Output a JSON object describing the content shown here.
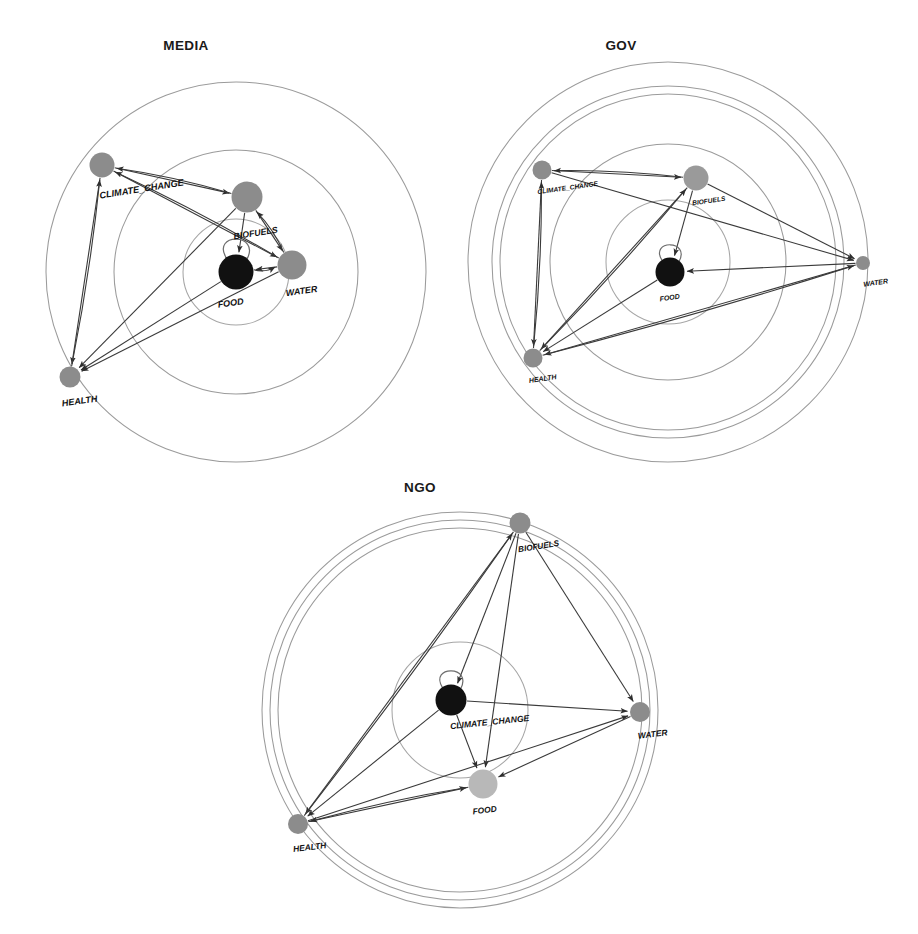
{
  "figure": {
    "type": "network-diagram",
    "node_names": [
      "CLIMATE_CHANGE",
      "BIOFUELS",
      "FOOD",
      "WATER",
      "HEALTH"
    ],
    "colors": {
      "node_dark": "#111111",
      "node_mid_gray": "#8c8c8c",
      "node_light_gray": "#b8b8b8",
      "ring_stroke": "#9b9b9b",
      "edge_stroke": "#3a3a3a",
      "title_text": "#1a1a1a",
      "background": "#ffffff"
    }
  },
  "panels": [
    {
      "id": "media",
      "title": "MEDIA",
      "title_x": 186,
      "title_y": 50,
      "center": {
        "x": 236,
        "y": 272
      },
      "rings": [
        {
          "r": 53
        },
        {
          "r": 122
        },
        {
          "r": 190
        }
      ],
      "nodes": [
        {
          "name": "CLIMATE_CHANGE",
          "label": "CLIMATE_CHANGE",
          "x": 102,
          "y": 165,
          "r": 12.5,
          "color": "#8c8c8c",
          "label_x": 142,
          "label_y": 192,
          "label_size": 9.2,
          "label_rotate": -9
        },
        {
          "name": "BIOFUELS",
          "label": "BIOFUELS",
          "x": 247,
          "y": 197,
          "r": 15.5,
          "color": "#8c8c8c",
          "label_x": 256,
          "label_y": 236,
          "label_size": 8.8,
          "label_rotate": -9
        },
        {
          "name": "FOOD",
          "label": "FOOD",
          "x": 236,
          "y": 272,
          "r": 17.5,
          "color": "#111111",
          "label_x": 231,
          "label_y": 306,
          "label_size": 9.0,
          "label_rotate": -8
        },
        {
          "name": "WATER",
          "label": "WATER",
          "x": 292,
          "y": 265,
          "r": 14.5,
          "color": "#8c8c8c",
          "label_x": 302,
          "label_y": 294,
          "label_size": 9.0,
          "label_rotate": -8
        },
        {
          "name": "HEALTH",
          "label": "HEALTH",
          "x": 70,
          "y": 377,
          "r": 10.5,
          "color": "#8c8c8c",
          "label_x": 80,
          "label_y": 404,
          "label_size": 9.0,
          "label_rotate": -8
        }
      ],
      "edges": [
        {
          "from": "CLIMATE_CHANGE",
          "to": "BIOFUELS",
          "arrow": true
        },
        {
          "from": "BIOFUELS",
          "to": "CLIMATE_CHANGE",
          "arrow": true
        },
        {
          "from": "CLIMATE_CHANGE",
          "to": "HEALTH",
          "arrow": true
        },
        {
          "from": "HEALTH",
          "to": "CLIMATE_CHANGE",
          "arrow": true
        },
        {
          "from": "CLIMATE_CHANGE",
          "to": "WATER",
          "arrow": true
        },
        {
          "from": "WATER",
          "to": "CLIMATE_CHANGE",
          "arrow": true
        },
        {
          "from": "BIOFUELS",
          "to": "FOOD",
          "arrow": true
        },
        {
          "from": "BIOFUELS",
          "to": "HEALTH",
          "arrow": true
        },
        {
          "from": "BIOFUELS",
          "to": "WATER",
          "arrow": true
        },
        {
          "from": "WATER",
          "to": "BIOFUELS",
          "arrow": true
        },
        {
          "from": "WATER",
          "to": "FOOD",
          "arrow": true
        },
        {
          "from": "FOOD",
          "to": "WATER",
          "arrow": true
        },
        {
          "from": "FOOD",
          "to": "HEALTH",
          "arrow": true
        },
        {
          "from": "WATER",
          "to": "HEALTH",
          "arrow": true
        }
      ],
      "self_loops": [
        {
          "node": "FOOD"
        }
      ]
    },
    {
      "id": "gov",
      "title": "GOV",
      "title_x": 621,
      "title_y": 50,
      "center": {
        "x": 668,
        "y": 262
      },
      "rings": [
        {
          "r": 62
        },
        {
          "r": 118
        },
        {
          "r": 168
        },
        {
          "r": 176
        },
        {
          "r": 200
        }
      ],
      "nodes": [
        {
          "name": "CLIMATE_CHANGE",
          "label": "CLIMATE_CHANGE",
          "x": 542,
          "y": 170,
          "r": 9.5,
          "color": "#8c8c8c",
          "label_x": 568,
          "label_y": 190,
          "label_size": 6.6,
          "label_rotate": -8
        },
        {
          "name": "BIOFUELS",
          "label": "BIOFUELS",
          "x": 696,
          "y": 178,
          "r": 12.5,
          "color": "#9a9a9a",
          "label_x": 709,
          "label_y": 203,
          "label_size": 6.6,
          "label_rotate": -8
        },
        {
          "name": "FOOD",
          "label": "FOOD",
          "x": 670,
          "y": 272,
          "r": 14.5,
          "color": "#111111",
          "label_x": 670,
          "label_y": 300,
          "label_size": 7.0,
          "label_rotate": -8
        },
        {
          "name": "WATER",
          "label": "WATER",
          "x": 863,
          "y": 263,
          "r": 7.0,
          "color": "#8c8c8c",
          "label_x": 876,
          "label_y": 285,
          "label_size": 7.0,
          "label_rotate": -8
        },
        {
          "name": "HEALTH",
          "label": "HEALTH",
          "x": 533,
          "y": 358,
          "r": 9.5,
          "color": "#8c8c8c",
          "label_x": 543,
          "label_y": 381,
          "label_size": 7.0,
          "label_rotate": -8
        }
      ],
      "edges": [
        {
          "from": "CLIMATE_CHANGE",
          "to": "BIOFUELS",
          "arrow": true
        },
        {
          "from": "BIOFUELS",
          "to": "CLIMATE_CHANGE",
          "arrow": true
        },
        {
          "from": "CLIMATE_CHANGE",
          "to": "HEALTH",
          "arrow": true
        },
        {
          "from": "CLIMATE_CHANGE",
          "to": "WATER",
          "arrow": true
        },
        {
          "from": "BIOFUELS",
          "to": "FOOD",
          "arrow": true
        },
        {
          "from": "BIOFUELS",
          "to": "WATER",
          "arrow": true
        },
        {
          "from": "BIOFUELS",
          "to": "HEALTH",
          "arrow": true
        },
        {
          "from": "WATER",
          "to": "FOOD",
          "arrow": true
        },
        {
          "from": "WATER",
          "to": "HEALTH",
          "arrow": true
        },
        {
          "from": "HEALTH",
          "to": "WATER",
          "arrow": true
        },
        {
          "from": "HEALTH",
          "to": "BIOFUELS",
          "arrow": true
        },
        {
          "from": "FOOD",
          "to": "HEALTH",
          "arrow": true
        },
        {
          "from": "HEALTH",
          "to": "CLIMATE_CHANGE",
          "arrow": true
        }
      ],
      "self_loops": [
        {
          "node": "FOOD"
        }
      ]
    },
    {
      "id": "ngo",
      "title": "NGO",
      "title_x": 420,
      "title_y": 492,
      "center": {
        "x": 460,
        "y": 710
      },
      "rings": [
        {
          "r": 68
        },
        {
          "r": 182
        },
        {
          "r": 190
        },
        {
          "r": 198
        }
      ],
      "nodes": [
        {
          "name": "BIOFUELS",
          "label": "BIOFUELS",
          "x": 520,
          "y": 523,
          "r": 10.5,
          "color": "#8c8c8c",
          "label_x": 539,
          "label_y": 549,
          "label_size": 8.2,
          "label_rotate": -9
        },
        {
          "name": "CLIMATE_CHANGE",
          "label": "CLIMATE_CHANGE",
          "x": 451,
          "y": 700,
          "r": 15.5,
          "color": "#111111",
          "label_x": 490,
          "label_y": 725,
          "label_size": 8.6,
          "label_rotate": -6
        },
        {
          "name": "WATER",
          "label": "WATER",
          "x": 640,
          "y": 712,
          "r": 10.0,
          "color": "#8c8c8c",
          "label_x": 653,
          "label_y": 737,
          "label_size": 8.4,
          "label_rotate": -7
        },
        {
          "name": "FOOD",
          "label": "FOOD",
          "x": 483,
          "y": 784,
          "r": 14.5,
          "color": "#b8b8b8",
          "label_x": 485,
          "label_y": 813,
          "label_size": 8.4,
          "label_rotate": -7
        },
        {
          "name": "HEALTH",
          "label": "HEALTH",
          "x": 298,
          "y": 824,
          "r": 10.0,
          "color": "#8c8c8c",
          "label_x": 310,
          "label_y": 850,
          "label_size": 8.4,
          "label_rotate": -7
        }
      ],
      "edges": [
        {
          "from": "BIOFUELS",
          "to": "CLIMATE_CHANGE",
          "arrow": true
        },
        {
          "from": "BIOFUELS",
          "to": "WATER",
          "arrow": true
        },
        {
          "from": "BIOFUELS",
          "to": "FOOD",
          "arrow": true
        },
        {
          "from": "BIOFUELS",
          "to": "HEALTH",
          "arrow": true
        },
        {
          "from": "HEALTH",
          "to": "BIOFUELS",
          "arrow": true
        },
        {
          "from": "CLIMATE_CHANGE",
          "to": "WATER",
          "arrow": true
        },
        {
          "from": "CLIMATE_CHANGE",
          "to": "FOOD",
          "arrow": true
        },
        {
          "from": "CLIMATE_CHANGE",
          "to": "HEALTH",
          "arrow": true
        },
        {
          "from": "HEALTH",
          "to": "WATER",
          "arrow": true
        },
        {
          "from": "HEALTH",
          "to": "FOOD",
          "arrow": true
        },
        {
          "from": "WATER",
          "to": "FOOD",
          "arrow": true
        },
        {
          "from": "FOOD",
          "to": "HEALTH",
          "arrow": true
        }
      ],
      "self_loops": [
        {
          "node": "CLIMATE_CHANGE"
        }
      ]
    }
  ]
}
